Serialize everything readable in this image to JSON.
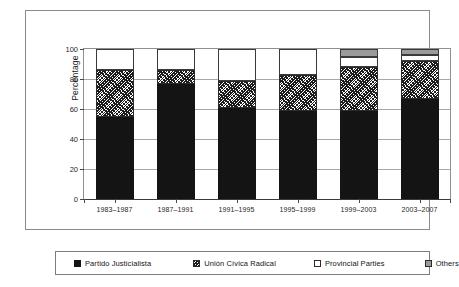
{
  "chart_data": {
    "type": "bar",
    "subtype": "stacked-bar-100",
    "title": "",
    "xlabel": "",
    "ylabel": "Percentage",
    "ylim": [
      0,
      100
    ],
    "yticks": [
      0,
      20,
      40,
      60,
      80,
      100
    ],
    "ytick_labels": [
      "0",
      "20",
      "40",
      "60",
      "80",
      "100"
    ],
    "grid": true,
    "legend_position": "bottom",
    "categories": [
      "1983–1987",
      "1987–1991",
      "1991–1995",
      "1995–1999",
      "1999–2003",
      "2003–2007"
    ],
    "series": [
      {
        "name": "Partido Justicialista",
        "color": "#141414",
        "pattern": "solid-black",
        "values": [
          54.5,
          76.5,
          61,
          58.5,
          58.5,
          67
        ]
      },
      {
        "name": "Unión Cívica Radical",
        "color": "#1c1c1c",
        "pattern": "diagonal-hatch",
        "values": [
          31.5,
          9.5,
          18,
          24.5,
          29.5,
          25
        ]
      },
      {
        "name": "Provincial Parties",
        "color": "#ffffff",
        "pattern": "white",
        "values": [
          14,
          14,
          21,
          17,
          7,
          4
        ]
      },
      {
        "name": "Others",
        "color": "#9a9a9a",
        "pattern": "solid-gray",
        "values": [
          0,
          0,
          0,
          0,
          5,
          4
        ]
      }
    ]
  },
  "axis": {
    "y_title": "Percentage"
  },
  "legend": {
    "items": [
      {
        "label": "Partido Justicialista",
        "swatch": "black-square-icon"
      },
      {
        "label": "Unión Cívica Radical",
        "swatch": "hatched-square-icon"
      },
      {
        "label": "Provincial Parties",
        "swatch": "white-square-icon"
      },
      {
        "label": "Others",
        "swatch": "gray-square-icon"
      }
    ]
  },
  "colors": {
    "pj": "#141414",
    "ucr": "#1c1c1c",
    "provincial": "#ffffff",
    "others": "#9a9a9a",
    "frame": "#8a8a8a",
    "grid": "#a8a8a8",
    "background": "#ffffff"
  }
}
